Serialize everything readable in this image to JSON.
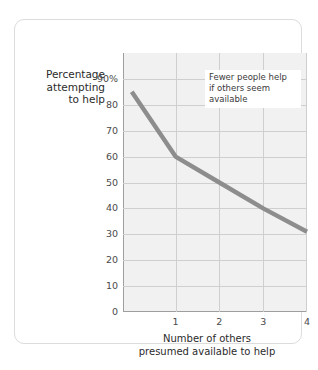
{
  "chart_data": {
    "type": "line",
    "title": "",
    "xlabel": "Number of others presumed available to help",
    "ylabel": "Percentage attempting to help",
    "xlabel_lines": [
      "Number of others",
      "presumed available to help"
    ],
    "ylabel_lines": [
      "Percentage",
      "attempting",
      "to help"
    ],
    "x": [
      0,
      1,
      2,
      3,
      4
    ],
    "values": [
      85,
      60,
      50,
      40,
      31
    ],
    "series": [
      {
        "name": "Percentage attempting to help",
        "values": [
          85,
          60,
          50,
          40,
          31
        ],
        "color": "#8d8d8d"
      }
    ],
    "xlim": [
      -0.2,
      4
    ],
    "ylim": [
      0,
      100
    ],
    "xticks": [
      1,
      2,
      3,
      4
    ],
    "xticklabels": [
      "1",
      "2",
      "3",
      "4"
    ],
    "yticks": [
      0,
      10,
      20,
      30,
      40,
      50,
      60,
      70,
      80,
      90
    ],
    "yticklabels": [
      "0",
      "10",
      "20",
      "30",
      "40",
      "50",
      "60",
      "70",
      "80",
      "90%"
    ],
    "grid": true,
    "legend": "none",
    "plot_background": "#f1f1f1",
    "gridline_color": "#cfcfcf",
    "axis_color": "#9e9e9e",
    "annotations": [
      {
        "lines": [
          "Fewer people help",
          "if others seem",
          "available"
        ],
        "text": "Fewer people help if others seem available"
      }
    ]
  }
}
